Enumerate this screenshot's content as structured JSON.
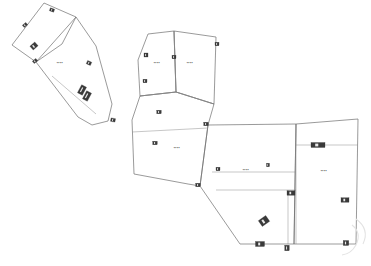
{
  "document": {
    "type": "scanned-cadastral-site-plan",
    "background_color": "#ffffff",
    "outline_color": "#6e6e6e",
    "interior_line_color": "#8f8f8f",
    "label_color": "#4a4a4a",
    "marker_color": "#3a3a3a",
    "canvas": {
      "width": 371,
      "height": 266
    }
  },
  "fills": {
    "shaded_parcel": "#c6c6c6",
    "hatched_parcel": "#f3f3f3",
    "hatch_stroke": "#d8d8d8",
    "dot_stroke": "#cfcfcf"
  },
  "parcels": [
    {
      "id": "parcel-shaded-nw",
      "name": "shaded-parcel-northwest",
      "fill": "shaded",
      "points": "44,3 76,17 62,44 36,62 12,45",
      "label": "",
      "label_x": 0,
      "label_y": 0
    },
    {
      "id": "parcel-strip-nw",
      "name": "parcel-strip-northwest",
      "fill": "hatched",
      "points": "76,17 96,46 112,104 108,121 92,125 78,117 36,62",
      "label": "▪▪▪▪",
      "label_x": 60,
      "label_y": 63
    },
    {
      "id": "parcel-north-left",
      "name": "parcel-north-left",
      "fill": "hatched",
      "points": "148,34 174,31 176,92 140,96 138,60",
      "label": "▪▪▪▪",
      "label_x": 157,
      "label_y": 63
    },
    {
      "id": "parcel-north-right",
      "name": "parcel-north-right",
      "fill": "hatched",
      "points": "174,31 216,37 214,104 176,92",
      "label": "▪▪▪▪",
      "label_x": 190,
      "label_y": 63
    },
    {
      "id": "parcel-central",
      "name": "parcel-central",
      "fill": "hatched",
      "points": "140,96 176,92 214,104 208,125 200,186 188,184 134,174 132,120",
      "label": "▪▪▪▪",
      "label_x": 177,
      "label_y": 148
    },
    {
      "id": "parcel-east-left",
      "name": "parcel-east-left",
      "fill": "hatched",
      "points": "208,125 296,124 294,244 240,244 200,186",
      "label": "▪▪▪▪",
      "label_x": 246,
      "label_y": 170
    },
    {
      "id": "parcel-east-right",
      "name": "parcel-east-right",
      "fill": "hatched",
      "points": "296,124 358,119 356,244 294,244",
      "label": "▪▪▪▪",
      "label_x": 324,
      "label_y": 171
    }
  ],
  "interior_lines": [
    {
      "name": "divider-north-vertical",
      "d": "M174,31 L176,92"
    },
    {
      "name": "divider-central-top",
      "d": "M140,96 L176,92 L214,104"
    },
    {
      "name": "divider-east-upper",
      "d": "M296,124 L296,244"
    },
    {
      "name": "divider-east-row-1",
      "d": "M296,145 L358,145"
    },
    {
      "name": "divider-east-row-2",
      "d": "M212,172 L296,172"
    },
    {
      "name": "divider-east-row-3",
      "d": "M216,190 L296,190"
    },
    {
      "name": "divider-east-col",
      "d": "M288,190 L288,244"
    },
    {
      "name": "divider-strip-nw-inner",
      "d": "M52,76 L96,114"
    },
    {
      "name": "divider-central-mid",
      "d": "M132,132 L208,128"
    }
  ],
  "markers": [
    {
      "name": "survey-marker",
      "x": 52,
      "y": 10,
      "w": 4.5,
      "h": 3.0,
      "rot": 20
    },
    {
      "name": "survey-marker",
      "x": 25,
      "y": 25,
      "w": 4.5,
      "h": 3.0,
      "rot": -40
    },
    {
      "name": "survey-marker",
      "x": 34,
      "y": 46,
      "w": 6.5,
      "h": 5.0,
      "rot": -42
    },
    {
      "name": "survey-marker",
      "x": 35,
      "y": 61,
      "w": 4.5,
      "h": 3.0,
      "rot": -40
    },
    {
      "name": "survey-marker",
      "x": 89,
      "y": 63,
      "w": 4.5,
      "h": 3.5,
      "rot": 25
    },
    {
      "name": "building-marker",
      "x": 82,
      "y": 90,
      "w": 5.5,
      "h": 9.0,
      "rot": 28
    },
    {
      "name": "building-marker",
      "x": 87,
      "y": 96,
      "w": 5.5,
      "h": 9.0,
      "rot": 28
    },
    {
      "name": "survey-marker",
      "x": 113,
      "y": 120,
      "w": 4.5,
      "h": 3.5,
      "rot": 10
    },
    {
      "name": "survey-marker",
      "x": 146,
      "y": 55,
      "w": 4.0,
      "h": 4.0,
      "rot": 0
    },
    {
      "name": "survey-marker",
      "x": 174,
      "y": 57,
      "w": 4.0,
      "h": 3.5,
      "rot": 0
    },
    {
      "name": "survey-marker",
      "x": 217,
      "y": 44,
      "w": 4.0,
      "h": 3.5,
      "rot": 0
    },
    {
      "name": "survey-marker",
      "x": 145,
      "y": 81,
      "w": 4.0,
      "h": 3.5,
      "rot": 0
    },
    {
      "name": "survey-marker",
      "x": 159,
      "y": 112,
      "w": 4.5,
      "h": 3.5,
      "rot": 0
    },
    {
      "name": "survey-marker",
      "x": 206,
      "y": 124,
      "w": 4.5,
      "h": 3.5,
      "rot": 0
    },
    {
      "name": "survey-marker",
      "x": 155,
      "y": 143,
      "w": 4.5,
      "h": 3.5,
      "rot": 0
    },
    {
      "name": "survey-marker",
      "x": 198,
      "y": 185,
      "w": 4.5,
      "h": 3.5,
      "rot": 0
    },
    {
      "name": "survey-marker",
      "x": 218,
      "y": 169,
      "w": 4.0,
      "h": 3.5,
      "rot": 0
    },
    {
      "name": "survey-marker",
      "x": 268,
      "y": 165,
      "w": 3.0,
      "h": 3.5,
      "rot": 0
    },
    {
      "name": "building-marker",
      "x": 318,
      "y": 145,
      "w": 14.0,
      "h": 5.0,
      "rot": 0
    },
    {
      "name": "survey-marker",
      "x": 291,
      "y": 193,
      "w": 8.0,
      "h": 4.5,
      "rot": 0
    },
    {
      "name": "survey-marker",
      "x": 345,
      "y": 200,
      "w": 8.0,
      "h": 4.5,
      "rot": 0
    },
    {
      "name": "building-marker",
      "x": 264,
      "y": 221,
      "w": 9.0,
      "h": 7.0,
      "rot": -35
    },
    {
      "name": "survey-marker",
      "x": 260,
      "y": 244,
      "w": 9.0,
      "h": 5.0,
      "rot": 0
    },
    {
      "name": "survey-marker",
      "x": 287,
      "y": 248,
      "w": 4.5,
      "h": 5.5,
      "rot": 0
    },
    {
      "name": "survey-marker",
      "x": 346,
      "y": 243,
      "w": 5.5,
      "h": 5.0,
      "rot": 0
    }
  ],
  "watermark": {
    "name": "scan-watermark",
    "visible": true,
    "color": "#e3e3e3"
  }
}
